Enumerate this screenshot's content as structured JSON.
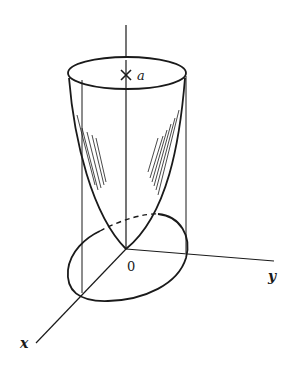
{
  "diagram": {
    "labels": {
      "apex": "a",
      "origin": "0",
      "x_axis": "x",
      "y_axis": "y"
    },
    "colors": {
      "stroke": "#1a1a1a",
      "background": "#ffffff"
    }
  }
}
